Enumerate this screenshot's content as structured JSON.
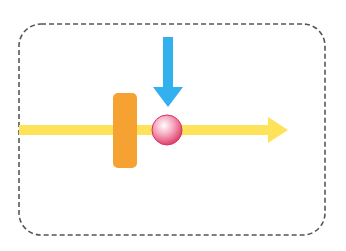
{
  "diagram": {
    "elements": [
      {
        "name": "dashed-frame",
        "type": "rounded-rectangle",
        "style": "dashed"
      },
      {
        "name": "motion-arrow",
        "type": "arrow",
        "direction": "right"
      },
      {
        "name": "barrier",
        "type": "rounded-rectangle"
      },
      {
        "name": "ball",
        "type": "sphere"
      },
      {
        "name": "force-arrow",
        "type": "arrow",
        "direction": "down"
      }
    ],
    "colors": {
      "frame": "#555555",
      "motion_arrow": "#fde25a",
      "barrier": "#f5a233",
      "ball": "#e8537b",
      "ball_highlight": "#ffffff",
      "force_arrow": "#33b0ee"
    }
  }
}
